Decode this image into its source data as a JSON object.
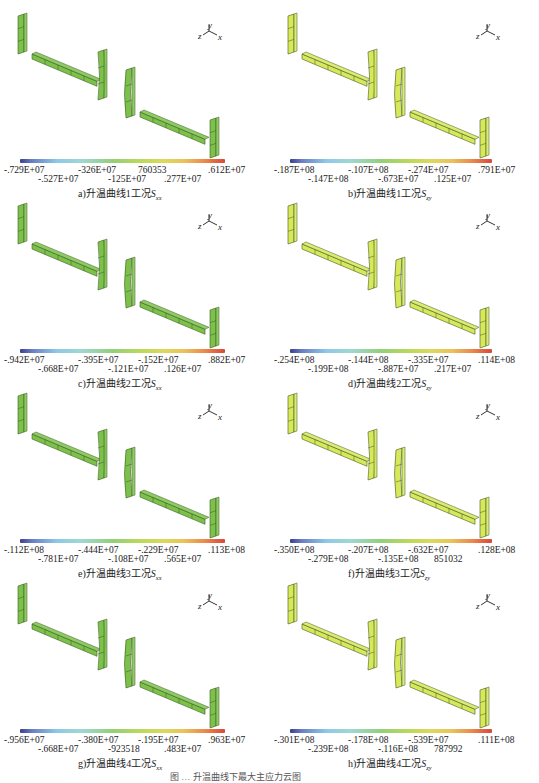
{
  "figure": {
    "caption_partial": "图 … 升温曲线下最大主应力云图",
    "colorbar_gradient": [
      "#3a3f8f",
      "#6b7fc4",
      "#8dc9e6",
      "#9fd8d2",
      "#93cf7a",
      "#b8d95a",
      "#dcd95b",
      "#eac35a",
      "#ea8a4d",
      "#d9483a"
    ],
    "axes_triad": {
      "y": "y",
      "z": "z",
      "x": "x"
    },
    "panels": [
      {
        "id": "a",
        "caption": "a)升温曲线1工况",
        "sym": "S",
        "sub": "xx",
        "member_color": "#7cc24a",
        "labels_top": [
          "-.729E+07",
          "-326E+07",
          "760353",
          ".612E+07"
        ],
        "labels_bottom": [
          "-.527E+07",
          "-125E+07",
          ".277E+07"
        ]
      },
      {
        "id": "b",
        "caption": "b)升温曲线1工况",
        "sym": "S",
        "sub": "zy",
        "member_color": "#d8e85a",
        "labels_top": [
          "-.187E+08",
          "-.107E+08",
          "-.274E+07",
          ".791E+07"
        ],
        "labels_bottom": [
          "-.147E+08",
          "-.673E+07",
          ".125E+07"
        ]
      },
      {
        "id": "c",
        "caption": "c)升温曲线2工况",
        "sym": "S",
        "sub": "xx",
        "member_color": "#7cc24a",
        "labels_top": [
          "-.942E+07",
          "-.395E+07",
          "-.152E+07",
          ".882E+07"
        ],
        "labels_bottom": [
          "-.668E+07",
          "-.121E+07",
          ".126E+07"
        ]
      },
      {
        "id": "d",
        "caption": "d)升温曲线2工况",
        "sym": "S",
        "sub": "zy",
        "member_color": "#d8e85a",
        "labels_top": [
          "-.254E+08",
          "-.144E+08",
          "-.335E+07",
          ".114E+08"
        ],
        "labels_bottom": [
          "-.199E+08",
          "-.887E+07",
          ".217E+07"
        ]
      },
      {
        "id": "e",
        "caption": "e)升温曲线3工况",
        "sym": "S",
        "sub": "xx",
        "member_color": "#7cc24a",
        "labels_top": [
          "-.112E+08",
          "-.444E+07",
          "-.229E+07",
          ".113E+08"
        ],
        "labels_bottom": [
          "-.781E+07",
          "-.108E+07",
          ".565E+07"
        ]
      },
      {
        "id": "f",
        "caption": "f)升温曲线3工况",
        "sym": "S",
        "sub": "zy",
        "member_color": "#d8e85a",
        "labels_top": [
          "-.350E+08",
          "-.207E+08",
          "-.632E+07",
          ".128E+08"
        ],
        "labels_bottom": [
          "-.279E+08",
          "-.135E+08",
          "851032"
        ]
      },
      {
        "id": "g",
        "caption": "g)升温曲线4工况",
        "sym": "S",
        "sub": "xx",
        "member_color": "#7cc24a",
        "labels_top": [
          "-.956E+07",
          "-.380E+07",
          "-.195E+07",
          ".963E+07"
        ],
        "labels_bottom": [
          "-.668E+07",
          "-923518",
          ".483E+07"
        ]
      },
      {
        "id": "h",
        "caption": "h)升温曲线4工况",
        "sym": "S",
        "sub": "zy",
        "member_color": "#d8e85a",
        "labels_top": [
          "-.301E+08",
          "-.178E+08",
          "-.539E+07",
          ".111E+08"
        ],
        "labels_bottom": [
          "-.239E+08",
          "-.116E+08",
          "787992"
        ]
      }
    ]
  }
}
